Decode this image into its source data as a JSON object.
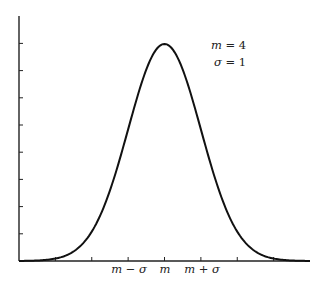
{
  "chart_data": {
    "type": "line",
    "title": "",
    "xlabel": "",
    "ylabel": "",
    "distribution": "normal",
    "params": {
      "m": 4,
      "sigma": 1
    },
    "legend": [
      "m = 4",
      "σ = 1"
    ],
    "xlim": [
      0,
      8
    ],
    "ylim": [
      0,
      0.44
    ],
    "x_ticks": [
      1,
      2,
      3,
      4,
      5,
      6,
      7
    ],
    "x_tick_labels": [
      {
        "x": 3,
        "label": "m − σ"
      },
      {
        "x": 4,
        "label": "m"
      },
      {
        "x": 5,
        "label": "m + σ"
      }
    ],
    "y_ticks": [
      0.05,
      0.1,
      0.15,
      0.2,
      0.25,
      0.3,
      0.35,
      0.4
    ],
    "y_tick_labels": [],
    "grid": false,
    "series": [
      {
        "name": "N(4, 1) density",
        "x": [
          0,
          0.5,
          1,
          1.5,
          2,
          2.5,
          3,
          3.5,
          4,
          4.5,
          5,
          5.5,
          6,
          6.5,
          7,
          7.5,
          8
        ],
        "values": [
          0.0001,
          0.0009,
          0.0044,
          0.0175,
          0.054,
          0.1295,
          0.242,
          0.3521,
          0.3989,
          0.3521,
          0.242,
          0.1295,
          0.054,
          0.0175,
          0.0044,
          0.0009,
          0.0001
        ]
      }
    ]
  },
  "labels": {
    "legend_m": "m = 4",
    "legend_sigma": "σ = 1",
    "tick_m_minus_sigma": "m − σ",
    "tick_m": "m",
    "tick_m_plus_sigma": "m + σ"
  }
}
